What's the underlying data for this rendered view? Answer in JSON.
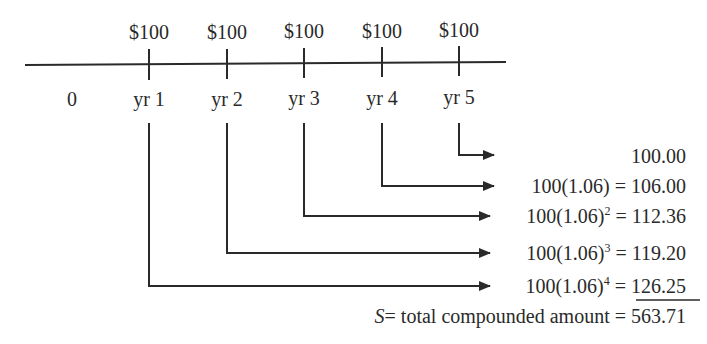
{
  "timeline": {
    "start_label": "0",
    "payments": [
      {
        "year_label": "yr 1",
        "amount": "$100"
      },
      {
        "year_label": "yr 2",
        "amount": "$100"
      },
      {
        "year_label": "yr 3",
        "amount": "$100"
      },
      {
        "year_label": "yr 4",
        "amount": "$100"
      },
      {
        "year_label": "yr 5",
        "amount": "$100"
      }
    ]
  },
  "compounding": {
    "rows": [
      {
        "source": "yr 5",
        "expr_base": "",
        "exponent": "",
        "eq": "",
        "value": "100.00"
      },
      {
        "source": "yr 4",
        "expr_base": "100(1.06)",
        "exponent": "",
        "eq": " = ",
        "value": "106.00"
      },
      {
        "source": "yr 3",
        "expr_base": "100(1.06)",
        "exponent": "2",
        "eq": " = ",
        "value": "112.36"
      },
      {
        "source": "yr 2",
        "expr_base": "100(1.06)",
        "exponent": "3",
        "eq": " = ",
        "value": "119.20"
      },
      {
        "source": "yr 1",
        "expr_base": "100(1.06)",
        "exponent": "4",
        "eq": " = ",
        "value": "126.25"
      }
    ],
    "total": {
      "symbol": "S",
      "label": "= total compounded amount = ",
      "value": "563.71"
    }
  },
  "colors": {
    "ink": "#2a2a2a",
    "background": "#ffffff"
  }
}
